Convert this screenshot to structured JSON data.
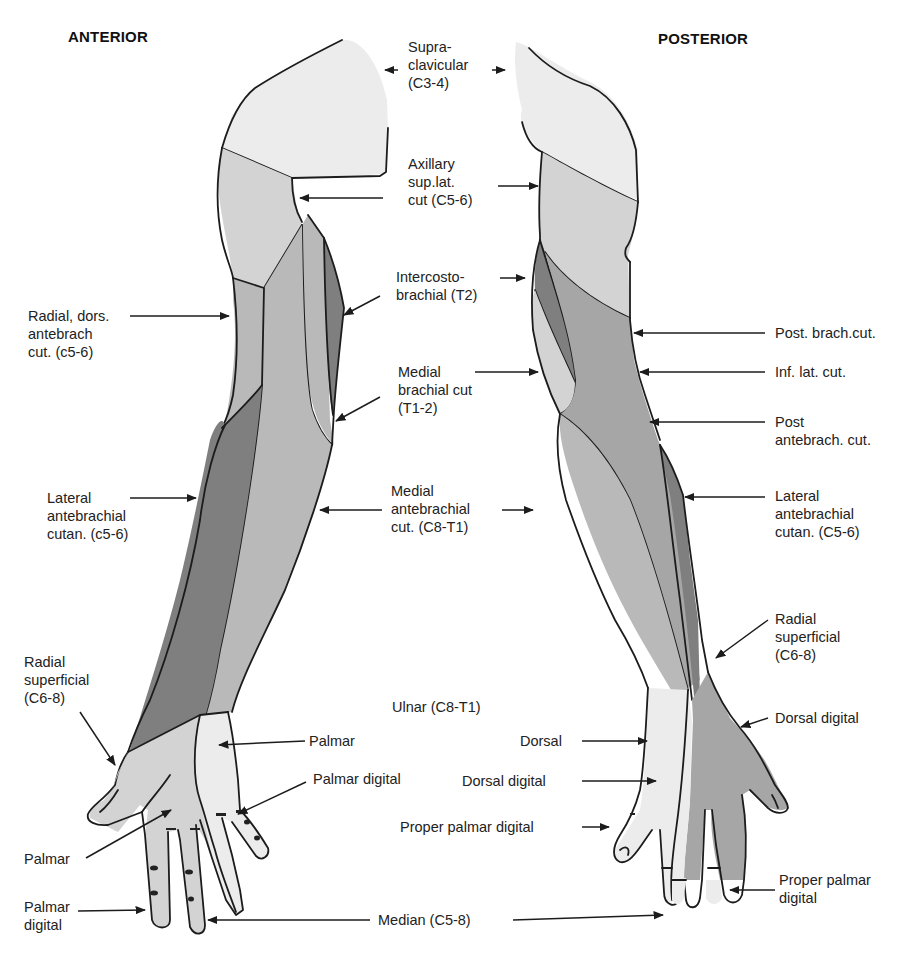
{
  "figure": {
    "anterior_title": "ANTERIOR",
    "posterior_title": "POSTERIOR"
  },
  "labels": {
    "supraclavicular": "Supra-\nclavicular\n(C3-4)",
    "axillary": "Axillary\nsup.lat.\ncut (C5-6)",
    "intercostobrachial": "Intercosto-\nbrachial (T2)",
    "radial_dors_antebrach": "Radial, dors.\nantebrach\ncut. (c5-6)",
    "medial_brachial": "Medial\nbrachial cut\n(T1-2)",
    "post_brach_cut": "Post. brach.cut.",
    "inf_lat_cut": "Inf. lat. cut.",
    "post_antebrach_cut": "Post\nantebrach. cut.",
    "lateral_antebrachial_ant": "Lateral\nantebrachial\ncutan. (c5-6)",
    "medial_antebrachial": "Medial\nantebrachial\ncut. (C8-T1)",
    "lateral_antebrachial_post": "Lateral\nantebrachial\ncutan. (C5-6)",
    "radial_superficial_post": "Radial\nsuperficial\n(C6-8)",
    "radial_superficial_ant": "Radial\nsuperficial\n(C6-8)",
    "ulnar": "Ulnar (C8-T1)",
    "palmar_ulnar": "Palmar",
    "dorsal_digital_radial": "Dorsal digital",
    "dorsal": "Dorsal",
    "palmar_digital_ulnar": "Palmar digital",
    "dorsal_digital_ulnar": "Dorsal digital",
    "palmar_median": "Palmar",
    "proper_palmar_digital_ulnar": "Proper palmar digital",
    "proper_palmar_digital_median": "Proper palmar\ndigital",
    "palmar_digital_median": "Palmar\ndigital",
    "median": "Median (C5-8)"
  },
  "shading_legend": {
    "lightest": "#ececec",
    "light": "#d3d3d3",
    "medium": "#b9b9b9",
    "medium_dark": "#a6a6a6",
    "dark": "#7f7f7f"
  }
}
